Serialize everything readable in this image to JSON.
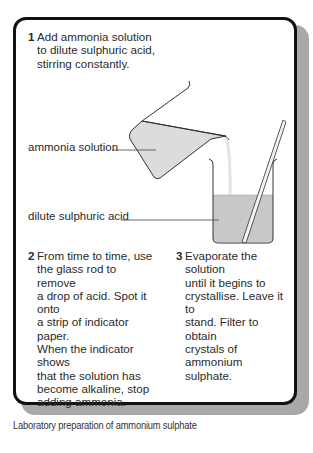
{
  "steps": [
    {
      "number": "1",
      "text": "Add ammonia solution to dilute sulphuric acid, stirring constantly.",
      "lines": [
        "Add ammonia solution",
        "to dilute sulphuric acid,",
        "stirring constantly."
      ]
    },
    {
      "number": "2",
      "text": "From time to time, use the glass rod to remove a drop of acid. Spot it onto a strip of indicator paper. When the indicator shows that the solution has become alkaline, stop adding ammonia.",
      "lines": [
        "From time to time, use",
        "the glass rod to remove",
        "a drop of acid. Spot it onto",
        "a strip of indicator paper.",
        "When the indicator shows",
        "that the solution has",
        "become alkaline, stop",
        "adding ammonia."
      ]
    },
    {
      "number": "3",
      "text": "Evaporate the solution until it begins to crystallise. Leave it to stand. Filter to obtain crystals of ammonium sulphate.",
      "lines": [
        "Evaporate the solution",
        "until it begins to",
        "crystallise. Leave it to",
        "stand. Filter to obtain",
        "crystals of ammonium",
        "sulphate."
      ]
    }
  ],
  "labels": {
    "ammonia_solution": "ammonia solution",
    "dilute_sulphuric_acid": "dilute sulphuric acid"
  },
  "caption": "Laboratory preparation of ammonium sulphate",
  "colors": {
    "border": "#111111",
    "shadow": "#a9a9a9",
    "liquid_fill": "#c8c8c8",
    "jug_fill": "#e0e0e0"
  }
}
